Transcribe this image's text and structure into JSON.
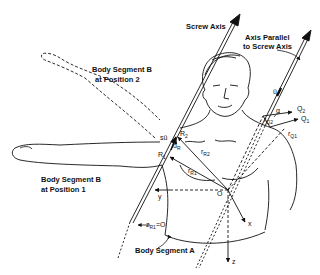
{
  "diagram": {
    "type": "anatomical screw-axis diagram",
    "labels": {
      "screw_axis": "Screw Axis",
      "parallel_axis_line1": "Axis Parallel",
      "parallel_axis_line2": "to Screw Axis",
      "segment_b_pos2_line1": "Body Segment B",
      "segment_b_pos2_line2": "at Position 2",
      "segment_b_pos1_line1": "Body Segment B",
      "segment_b_pos1_line2": "at Position 1",
      "segment_a": "Body Segment A"
    },
    "symbols": {
      "R2": "R",
      "R2_sub": "2",
      "R1": "R",
      "R1_sub": "1",
      "rR2": "r",
      "rR2_sub": "R2",
      "rR1": "r",
      "rR1_sub": "R1",
      "Q2": "Q",
      "Q2_sub": "2",
      "Q1": "Q",
      "Q1_sub": "1",
      "rQ2": "r",
      "rQ2_sub": "Q2",
      "rQ1": "r",
      "rQ1_sub": "Q1",
      "su": "sû",
      "dR": "d",
      "dR_sub": "R",
      "u": "û",
      "alpha": "α",
      "origin": "O",
      "x_axis": "x",
      "y_axis": "y",
      "z_axis": "z",
      "zR1": "z",
      "zR1_sub": "R1",
      "zR1_eq": "=O"
    }
  }
}
